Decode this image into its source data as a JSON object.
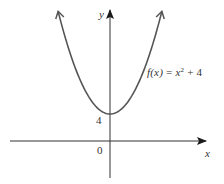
{
  "chart_data": {
    "type": "line",
    "title": "",
    "function": "f(x) = x^2 + 4",
    "annotation": {
      "name": "f(x)",
      "eq": "=",
      "base": "x",
      "exp": "2",
      "rest": "+ 4"
    },
    "xlabel": "x",
    "ylabel": "y",
    "tick_labels": {
      "y_intercept": "4",
      "origin": "0"
    },
    "vertex": [
      0,
      4
    ],
    "x": [
      -3.9,
      -3,
      -2,
      -1,
      0,
      1,
      2,
      3,
      3.9
    ],
    "values": [
      19.21,
      13,
      8,
      5,
      4,
      5,
      8,
      13,
      19.21
    ],
    "grid": false,
    "legend": "none",
    "arrows": {
      "curve_ends": true,
      "axes": true
    },
    "colors": {
      "curve": "#555555",
      "axes": "#222222",
      "text": "#333333"
    }
  }
}
